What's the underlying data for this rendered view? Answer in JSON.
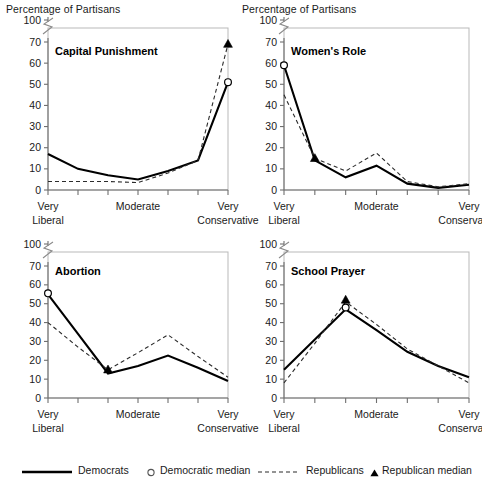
{
  "figure": {
    "y_axis_caption": "Percentage of Partisans",
    "y_ticks": [
      "0",
      "10",
      "20",
      "30",
      "40",
      "50",
      "60",
      "70",
      "100"
    ],
    "x_tick_labels_line1": [
      "Very",
      "Moderate",
      "Very"
    ],
    "x_tick_labels_line2": [
      "Liberal",
      "",
      "Conservative"
    ],
    "axis_break": true
  },
  "legend": {
    "democrats": "Democrats",
    "democratic_median": "Democratic median",
    "republicans": "Republicans",
    "republican_median": "Republican median",
    "dem_line_color": "#000000",
    "rep_line_color": "#2b2b2b",
    "dem_median_marker": "open-circle",
    "rep_median_marker": "filled-triangle"
  },
  "chart_data": [
    {
      "type": "line",
      "title": "Capital Punishment",
      "xlabel": "",
      "ylabel": "Percentage of Partisans",
      "ylim": [
        0,
        75
      ],
      "yticks": [
        0,
        10,
        20,
        30,
        40,
        50,
        60,
        70
      ],
      "grid": false,
      "categories": [
        "Very Liberal",
        "2",
        "3",
        "Moderate",
        "5",
        "6",
        "Very Conservative"
      ],
      "series": [
        {
          "name": "Democrats",
          "style": "solid",
          "values": [
            17,
            10,
            7,
            5,
            9,
            14,
            51
          ]
        },
        {
          "name": "Republicans",
          "style": "dashed",
          "values": [
            4,
            4,
            4,
            3.5,
            8,
            14,
            69
          ]
        }
      ],
      "medians": [
        {
          "name": "Democratic median",
          "x": "Very Conservative",
          "y": 51,
          "marker": "open-circle"
        },
        {
          "name": "Republican median",
          "x": "Very Conservative",
          "y": 69,
          "marker": "filled-triangle"
        }
      ]
    },
    {
      "type": "line",
      "title": "Women's Role",
      "xlabel": "",
      "ylabel": "Percentage of Partisans",
      "ylim": [
        0,
        75
      ],
      "yticks": [
        0,
        10,
        20,
        30,
        40,
        50,
        60,
        70
      ],
      "grid": false,
      "categories": [
        "Very Liberal",
        "2",
        "3",
        "Moderate",
        "5",
        "6",
        "Very Conservative"
      ],
      "series": [
        {
          "name": "Democrats",
          "style": "solid",
          "values": [
            59,
            14,
            6,
            11.5,
            3,
            1,
            2.5
          ]
        },
        {
          "name": "Republicans",
          "style": "dashed",
          "values": [
            45,
            15,
            9,
            17.5,
            4,
            1.5,
            3
          ]
        }
      ],
      "medians": [
        {
          "name": "Democratic median",
          "x": "Very Liberal",
          "y": 59,
          "marker": "open-circle"
        },
        {
          "name": "Republican median",
          "x": "2",
          "y": 15,
          "marker": "filled-triangle"
        }
      ]
    },
    {
      "type": "line",
      "title": "Abortion",
      "xlabel": "",
      "ylabel": "Percentage of Partisans",
      "ylim": [
        0,
        75
      ],
      "yticks": [
        0,
        10,
        20,
        30,
        40,
        50,
        60,
        70
      ],
      "grid": false,
      "categories": [
        "Very Liberal",
        "2",
        "3",
        "Moderate",
        "5",
        "6",
        "Very Conservative"
      ],
      "series": [
        {
          "name": "Democrats",
          "style": "solid",
          "values": [
            55,
            34,
            13,
            17,
            22.5,
            16,
            9
          ]
        },
        {
          "name": "Republicans",
          "style": "dashed",
          "values": [
            40,
            27,
            15,
            24,
            33.5,
            22,
            11
          ]
        }
      ],
      "medians": [
        {
          "name": "Democratic median",
          "x": "Very Liberal",
          "y": 55.5,
          "marker": "open-circle"
        },
        {
          "name": "Republican median",
          "x": "3",
          "y": 15,
          "marker": "filled-triangle"
        }
      ]
    },
    {
      "type": "line",
      "title": "School Prayer",
      "xlabel": "",
      "ylabel": "Percentage of Partisans",
      "ylim": [
        0,
        75
      ],
      "yticks": [
        0,
        10,
        20,
        30,
        40,
        50,
        60,
        70
      ],
      "grid": false,
      "categories": [
        "Very Liberal",
        "2",
        "3",
        "Moderate",
        "5",
        "6",
        "Very Conservative"
      ],
      "series": [
        {
          "name": "Democrats",
          "style": "solid",
          "values": [
            15,
            31,
            47,
            36,
            24.5,
            17,
            11
          ]
        },
        {
          "name": "Republicans",
          "style": "dashed",
          "values": [
            8,
            29,
            51,
            39,
            26,
            17,
            8
          ]
        }
      ],
      "medians": [
        {
          "name": "Democratic median",
          "x": "3",
          "y": 48,
          "marker": "open-circle"
        },
        {
          "name": "Republican median",
          "x": "3",
          "y": 52,
          "marker": "filled-triangle"
        }
      ]
    }
  ]
}
